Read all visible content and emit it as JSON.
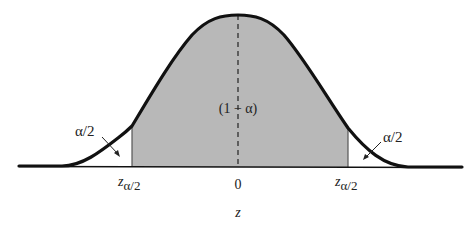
{
  "diagram": {
    "type": "normal-distribution-two-tailed",
    "center_label": "(1 − α)",
    "left_tail_label": "α/2",
    "right_tail_label": "α/2",
    "left_critical_label_base": "z",
    "left_critical_label_sub": "α/2",
    "right_critical_label_base": "z",
    "right_critical_label_sub": "α/2",
    "center_tick_label": "0",
    "axis_label": "z",
    "colors": {
      "curve": "#111111",
      "shaded_region": "#b8b8b8",
      "background": "#ffffff"
    }
  }
}
